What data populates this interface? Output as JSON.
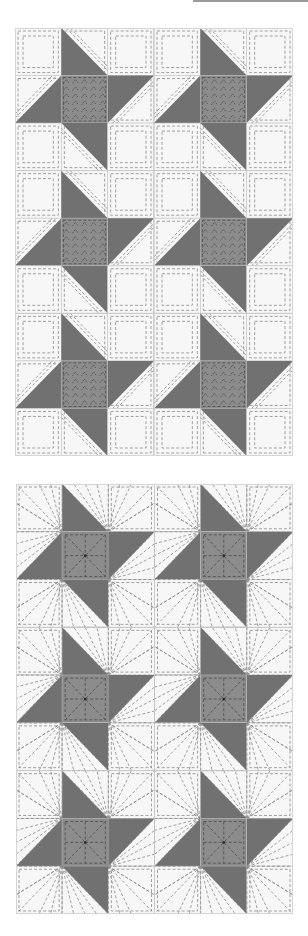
{
  "colors": {
    "background": "#ffffff",
    "light_fabric": "#f7f7f7",
    "star_points": "#717171",
    "star_center": "#8c8c8c",
    "seam_line": "#c9c9c9",
    "quilt_stitch": "#8a8a8a",
    "center_stitch": "#4a4a4a",
    "top_rule": "#9a9a9a"
  },
  "block": {
    "name": "Friendship Star",
    "grid": 3,
    "cells": [
      [
        "light",
        "tri-top",
        "light"
      ],
      [
        "tri-left",
        "center",
        "tri-right"
      ],
      [
        "light",
        "tri-bottom",
        "light"
      ]
    ]
  },
  "diagrams": [
    {
      "id": "quilt-diagram-1",
      "x": 15,
      "y": 28,
      "width": 278,
      "height": 428,
      "block_cols": 2,
      "block_rows": 3,
      "quilting": "nested-squares-and-echo-lines"
    },
    {
      "id": "quilt-diagram-2",
      "x": 16,
      "y": 484,
      "width": 277,
      "height": 430,
      "block_cols": 2,
      "block_rows": 3,
      "quilting": "radial-sunburst"
    }
  ]
}
